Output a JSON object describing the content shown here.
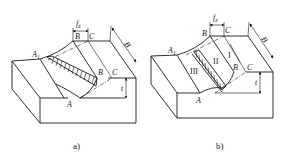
{
  "figure": {
    "panels": [
      {
        "id": "a",
        "caption": "a)",
        "labels": {
          "feed": "f",
          "feed_sub": "z",
          "A1": "A",
          "A1_sub": "1",
          "A": "A",
          "B_top": "B",
          "C_top": "C",
          "B_mid": "B",
          "C_mid": "C",
          "width": "B",
          "depth": "t"
        }
      },
      {
        "id": "b",
        "caption": "b)",
        "labels": {
          "feed": "f",
          "feed_sub": "z",
          "A1": "A",
          "A1_sub": "1",
          "A": "A",
          "B_top": "B",
          "C_top": "C",
          "B_mid": "B",
          "C_mid": "C",
          "width": "B",
          "depth": "t",
          "zone_I": "I",
          "zone_II": "II",
          "zone_III": "III"
        }
      }
    ],
    "colors": {
      "line": "#1a1a1a",
      "background": "#ffffff"
    }
  }
}
